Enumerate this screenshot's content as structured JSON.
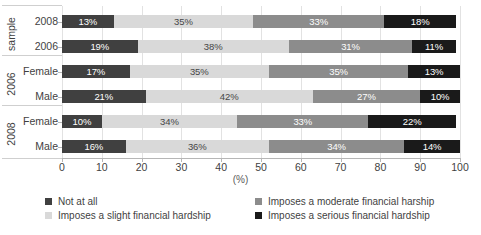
{
  "chart_data": {
    "type": "bar",
    "subtype": "horizontal-stacked-100",
    "title": "",
    "xlabel": "(%)",
    "ylabel": "",
    "xlim": [
      0,
      100
    ],
    "xticks": [
      0,
      10,
      20,
      30,
      40,
      50,
      60,
      70,
      80,
      90,
      100
    ],
    "grid": true,
    "legend_position": "bottom",
    "categories": [
      "2008",
      "2006",
      "Female",
      "Male",
      "Female",
      "Male"
    ],
    "groups": [
      {
        "label": "sample",
        "rows": [
          "2008",
          "2006"
        ]
      },
      {
        "label": "2006",
        "rows": [
          "Female",
          "Male"
        ]
      },
      {
        "label": "2008",
        "rows": [
          "Female",
          "Male"
        ]
      }
    ],
    "series": [
      {
        "name": "Not at all",
        "color": "#404040",
        "values": [
          13,
          19,
          17,
          21,
          10,
          16
        ]
      },
      {
        "name": "Imposes a slight financial hardship",
        "color": "#d9d9d9",
        "values": [
          35,
          38,
          35,
          42,
          34,
          36
        ]
      },
      {
        "name": "Imposes a moderate financial harship",
        "color": "#8c8c8c",
        "values": [
          33,
          31,
          35,
          27,
          33,
          34
        ]
      },
      {
        "name": "Imposes a serious financial hardship",
        "color": "#1a1a1a",
        "values": [
          18,
          11,
          13,
          10,
          22,
          14
        ]
      }
    ],
    "rows": [
      {
        "group": "sample",
        "label": "2008",
        "segments": [
          {
            "series": "Not at all",
            "value": 13,
            "data_label": "13%"
          },
          {
            "series": "Imposes a slight financial hardship",
            "value": 35,
            "data_label": "35%"
          },
          {
            "series": "Imposes a moderate financial harship",
            "value": 33,
            "data_label": "33%"
          },
          {
            "series": "Imposes a serious financial hardship",
            "value": 18,
            "data_label": "18%"
          }
        ]
      },
      {
        "group": "sample",
        "label": "2006",
        "segments": [
          {
            "series": "Not at all",
            "value": 19,
            "data_label": "19%"
          },
          {
            "series": "Imposes a slight financial hardship",
            "value": 38,
            "data_label": "38%"
          },
          {
            "series": "Imposes a moderate financial harship",
            "value": 31,
            "data_label": "31%"
          },
          {
            "series": "Imposes a serious financial hardship",
            "value": 11,
            "data_label": "11%"
          }
        ]
      },
      {
        "group": "2006",
        "label": "Female",
        "segments": [
          {
            "series": "Not at all",
            "value": 17,
            "data_label": "17%"
          },
          {
            "series": "Imposes a slight financial hardship",
            "value": 35,
            "data_label": "35%"
          },
          {
            "series": "Imposes a moderate financial harship",
            "value": 35,
            "data_label": "35%"
          },
          {
            "series": "Imposes a serious financial hardship",
            "value": 13,
            "data_label": "13%"
          }
        ]
      },
      {
        "group": "2006",
        "label": "Male",
        "segments": [
          {
            "series": "Not at all",
            "value": 21,
            "data_label": "21%"
          },
          {
            "series": "Imposes a slight financial hardship",
            "value": 42,
            "data_label": "42%"
          },
          {
            "series": "Imposes a moderate financial harship",
            "value": 27,
            "data_label": "27%"
          },
          {
            "series": "Imposes a serious financial hardship",
            "value": 10,
            "data_label": "10%"
          }
        ]
      },
      {
        "group": "2008",
        "label": "Female",
        "segments": [
          {
            "series": "Not at all",
            "value": 10,
            "data_label": "10%"
          },
          {
            "series": "Imposes a slight financial hardship",
            "value": 34,
            "data_label": "34%"
          },
          {
            "series": "Imposes a moderate financial harship",
            "value": 33,
            "data_label": "33%"
          },
          {
            "series": "Imposes a serious financial hardship",
            "value": 22,
            "data_label": "22%"
          }
        ]
      },
      {
        "group": "2008",
        "label": "Male",
        "segments": [
          {
            "series": "Not at all",
            "value": 16,
            "data_label": "16%"
          },
          {
            "series": "Imposes a slight financial hardship",
            "value": 36,
            "data_label": "36%"
          },
          {
            "series": "Imposes a moderate financial harship",
            "value": 34,
            "data_label": "34%"
          },
          {
            "series": "Imposes a serious financial hardship",
            "value": 14,
            "data_label": "14%"
          }
        ]
      }
    ]
  },
  "axis": {
    "x_title": "(%)",
    "tick_labels": [
      "0",
      "10",
      "20",
      "30",
      "40",
      "50",
      "60",
      "70",
      "80",
      "90",
      "100"
    ]
  },
  "group_labels": {
    "g0": "sample",
    "g1": "2006",
    "g2": "2008"
  },
  "row_labels": {
    "r0": "2008",
    "r1": "2006",
    "r2": "Female",
    "r3": "Male",
    "r4": "Female",
    "r5": "Male"
  },
  "legend": {
    "items": [
      {
        "label": "Not at all",
        "color": "#404040"
      },
      {
        "label": "Imposes a moderate financial harship",
        "color": "#8c8c8c"
      },
      {
        "label": "Imposes a slight financial hardship",
        "color": "#d9d9d9"
      },
      {
        "label": "Imposes a serious financial hardship",
        "color": "#1a1a1a"
      }
    ]
  }
}
